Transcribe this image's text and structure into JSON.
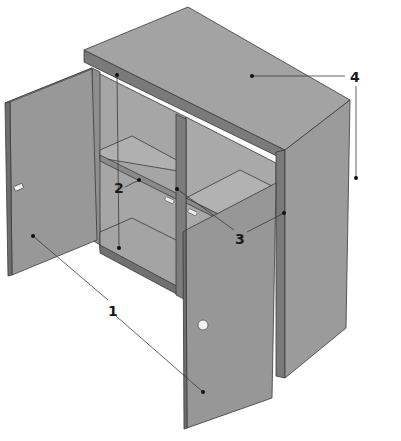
{
  "colors": {
    "background": "#ffffff",
    "top_face": "#a3a3a3",
    "side_face": "#9a9a9a",
    "door_face": "#979797",
    "interior": "#a8a8a8",
    "interior_dark": "#8c8c8c",
    "edge_dark": "#6e6e6e",
    "leader_line": "#3a3a3a",
    "label_text": "#1a1a1a"
  },
  "callouts": [
    {
      "id": "1",
      "label": "1",
      "target": "doors (left and right)"
    },
    {
      "id": "2",
      "label": "2",
      "target": "internal shelf / side panel"
    },
    {
      "id": "3",
      "label": "3",
      "target": "centre divider and shelf edge"
    },
    {
      "id": "4",
      "label": "4",
      "target": "top panel and outer side panel"
    }
  ]
}
